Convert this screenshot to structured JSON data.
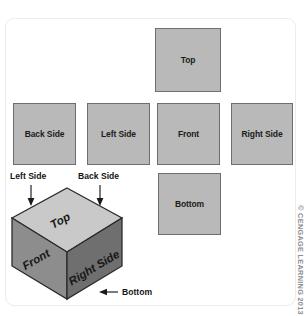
{
  "figure": {
    "panel": {
      "background_color": "#ffffff",
      "border_color": "#ececec"
    },
    "colors": {
      "square_fill": "#b9b9b9",
      "square_border": "#6e6e6e",
      "cube_top_face": "#c9c9c9",
      "cube_front_face": "#8d8d8d",
      "cube_right_face": "#6f6f6f",
      "cube_outline": "#2b2b2b",
      "text": "#1b1b1b",
      "credit_text": "#8d8d8d"
    },
    "flat_faces": [
      {
        "id": "top",
        "label": "Top"
      },
      {
        "id": "back",
        "label": "Back Side"
      },
      {
        "id": "left",
        "label": "Left Side"
      },
      {
        "id": "front",
        "label": "Front"
      },
      {
        "id": "right",
        "label": "Right Side"
      },
      {
        "id": "bottom",
        "label": "Bottom"
      }
    ],
    "cube": {
      "visible_faces": [
        {
          "id": "top",
          "label": "Top"
        },
        {
          "id": "front",
          "label": "Front"
        },
        {
          "id": "right",
          "label": "Right Side"
        }
      ],
      "callouts": [
        {
          "id": "left-side",
          "label": "Left Side",
          "arrow_direction": "down"
        },
        {
          "id": "back-side",
          "label": "Back Side",
          "arrow_direction": "down"
        },
        {
          "id": "bottom",
          "label": "Bottom",
          "arrow_direction": "left"
        }
      ]
    },
    "credit": {
      "text": "© CENGAGE LEARNING 2013"
    }
  }
}
